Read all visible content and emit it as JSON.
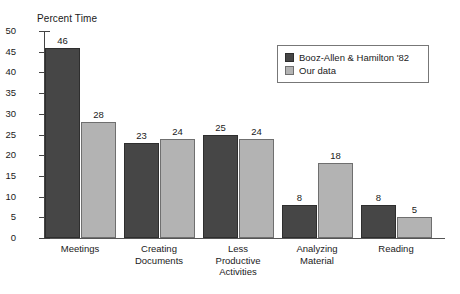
{
  "chart_data": {
    "type": "bar",
    "title": "",
    "ylabel": "Percent Time",
    "xlabel": "",
    "ylim": [
      0,
      50
    ],
    "yticks": [
      0,
      5,
      10,
      15,
      20,
      25,
      30,
      35,
      40,
      45,
      50
    ],
    "grid": false,
    "legend_position": "top-right",
    "categories": [
      "Meetings",
      "Creating\nDocuments",
      "Less\nProductive\nActivities",
      "Analyzing\nMaterial",
      "Reading"
    ],
    "category_lines": [
      [
        "Meetings"
      ],
      [
        "Creating",
        "Documents"
      ],
      [
        "Less",
        "Productive",
        "Activities"
      ],
      [
        "Analyzing",
        "Material"
      ],
      [
        "Reading"
      ]
    ],
    "series": [
      {
        "name": "Booz-Allen & Hamilton '82",
        "color": "#464646",
        "values": [
          46,
          23,
          25,
          8,
          8
        ]
      },
      {
        "name": "Our data",
        "color": "#b3b3b3",
        "values": [
          28,
          24,
          24,
          18,
          5
        ]
      }
    ]
  },
  "legend": {
    "items": [
      {
        "label": "Booz-Allen & Hamilton '82",
        "swatch": "s0"
      },
      {
        "label": "Our data",
        "swatch": "s1"
      }
    ]
  },
  "colors": {
    "series_dark": "#464646",
    "series_light": "#b3b3b3",
    "axis": "#444444",
    "text": "#1a1a1a",
    "background": "#ffffff"
  }
}
